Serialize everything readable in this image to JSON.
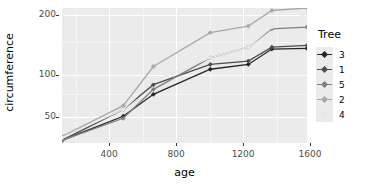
{
  "chart_data": {
    "type": "line",
    "title": "",
    "xlabel": "age",
    "ylabel": "circumference",
    "xlim": [
      118,
      1582
    ],
    "ylim": [
      28,
      214
    ],
    "yscale": "sqrt",
    "grid": true,
    "legend_position": "right",
    "legend_title": "Tree",
    "x": [
      118,
      484,
      664,
      1004,
      1231,
      1372,
      1582
    ],
    "xticks": [
      400,
      800,
      1200,
      1600
    ],
    "yticks": [
      50,
      100,
      200
    ],
    "series": [
      {
        "name": "3",
        "color": "#252525",
        "values": [
          30,
          51,
          75,
          108,
          115,
          139,
          140
        ]
      },
      {
        "name": "1",
        "color": "#4d4d4d",
        "values": [
          30,
          58,
          87,
          115,
          120,
          142,
          145
        ]
      },
      {
        "name": "5",
        "color": "#7f7f7f",
        "values": [
          30,
          49,
          81,
          125,
          142,
          174,
          177
        ]
      },
      {
        "name": "2",
        "color": "#a8a8a8",
        "values": [
          33,
          62,
          112,
          167,
          179,
          209,
          214
        ]
      },
      {
        "name": "4",
        "color": "#e8e8e8",
        "values": [
          32,
          58,
          92,
          125,
          142,
          177,
          203
        ]
      }
    ]
  },
  "axis": {
    "x_title": "age",
    "y_title": "circumference",
    "x_tick_labels": [
      "400",
      "800",
      "1200",
      "1600"
    ],
    "y_tick_labels": [
      "50",
      "100",
      "200"
    ]
  },
  "legend": {
    "title": "Tree",
    "items": [
      {
        "label": "3",
        "color": "#252525"
      },
      {
        "label": "1",
        "color": "#4d4d4d"
      },
      {
        "label": "5",
        "color": "#7f7f7f"
      },
      {
        "label": "2",
        "color": "#a8a8a8"
      },
      {
        "label": "4",
        "color": "#e8e8e8"
      }
    ]
  },
  "colors": {
    "panel_background": "#ebebeb",
    "grid_major": "#ffffff",
    "grid_minor": "#f5f5f5",
    "tick_label": "#4d4d4d",
    "axis_title": "#000000"
  }
}
